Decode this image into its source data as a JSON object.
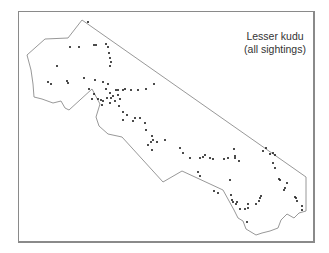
{
  "map": {
    "title_line1": "Lesser kudu",
    "title_line2": "(all sightings)",
    "boundary_color": "#8c8c8c",
    "point_color": "#222222",
    "frame_color": "#8a8a8a",
    "boundary_points": "82,20 306,177 306,211 299,213 294,218 287,214 281,220 278,228 270,231 262,233 256,235 251,232 246,229 243,221 238,218 234,210 223,190 182,171 163,182 122,137 108,134 99,126 96,117 100,104 92,89 69,110 65,108 61,101 53,103 42,99 34,97 33,84 31,70 27,55 45,39 68,38",
    "sightings": [
      [
        88,
        22
      ],
      [
        70,
        47
      ],
      [
        79,
        47
      ],
      [
        94,
        45
      ],
      [
        96,
        45
      ],
      [
        106,
        44
      ],
      [
        108,
        47
      ],
      [
        109,
        53
      ],
      [
        110,
        58
      ],
      [
        111,
        62
      ],
      [
        110,
        66
      ],
      [
        57,
        66
      ],
      [
        48,
        82
      ],
      [
        51,
        84
      ],
      [
        67,
        81
      ],
      [
        68,
        83
      ],
      [
        84,
        78
      ],
      [
        95,
        80
      ],
      [
        103,
        82
      ],
      [
        108,
        84
      ],
      [
        106,
        89
      ],
      [
        110,
        93
      ],
      [
        116,
        90
      ],
      [
        118,
        90
      ],
      [
        123,
        90
      ],
      [
        125,
        89
      ],
      [
        131,
        90
      ],
      [
        138,
        90
      ],
      [
        146,
        89
      ],
      [
        154,
        84
      ],
      [
        89,
        89
      ],
      [
        94,
        94
      ],
      [
        92,
        99
      ],
      [
        98,
        99
      ],
      [
        101,
        100
      ],
      [
        103,
        101
      ],
      [
        111,
        98
      ],
      [
        107,
        98
      ],
      [
        113,
        96
      ],
      [
        118,
        95
      ],
      [
        120,
        99
      ],
      [
        115,
        101
      ],
      [
        110,
        103
      ],
      [
        102,
        105
      ],
      [
        119,
        106
      ],
      [
        123,
        112
      ],
      [
        127,
        115
      ],
      [
        123,
        120
      ],
      [
        135,
        118
      ],
      [
        140,
        118
      ],
      [
        133,
        121
      ],
      [
        145,
        123
      ],
      [
        146,
        130
      ],
      [
        152,
        136
      ],
      [
        153,
        140
      ],
      [
        151,
        142
      ],
      [
        148,
        145
      ],
      [
        157,
        142
      ],
      [
        152,
        150
      ],
      [
        165,
        140
      ],
      [
        180,
        148
      ],
      [
        183,
        153
      ],
      [
        190,
        158
      ],
      [
        200,
        158
      ],
      [
        203,
        157
      ],
      [
        205,
        155
      ],
      [
        210,
        158
      ],
      [
        213,
        159
      ],
      [
        224,
        159
      ],
      [
        228,
        158
      ],
      [
        235,
        158
      ],
      [
        239,
        161
      ],
      [
        234,
        149
      ],
      [
        235,
        156
      ],
      [
        263,
        151
      ],
      [
        266,
        148
      ],
      [
        270,
        154
      ],
      [
        273,
        153
      ],
      [
        275,
        155
      ],
      [
        275,
        168
      ],
      [
        273,
        163
      ],
      [
        279,
        179
      ],
      [
        280,
        180
      ],
      [
        287,
        183
      ],
      [
        285,
        188
      ],
      [
        284,
        190
      ],
      [
        261,
        196
      ],
      [
        260,
        198
      ],
      [
        259,
        201
      ],
      [
        256,
        204
      ],
      [
        248,
        208
      ],
      [
        248,
        204
      ],
      [
        245,
        209
      ],
      [
        240,
        209
      ],
      [
        232,
        200
      ],
      [
        233,
        202
      ],
      [
        237,
        202
      ],
      [
        214,
        191
      ],
      [
        218,
        193
      ],
      [
        230,
        180
      ],
      [
        231,
        195
      ],
      [
        295,
        197
      ],
      [
        296,
        198
      ],
      [
        297,
        201
      ],
      [
        302,
        206
      ],
      [
        302,
        210
      ],
      [
        198,
        172
      ],
      [
        200,
        176
      ],
      [
        247,
        222
      ],
      [
        236,
        204
      ]
    ]
  }
}
